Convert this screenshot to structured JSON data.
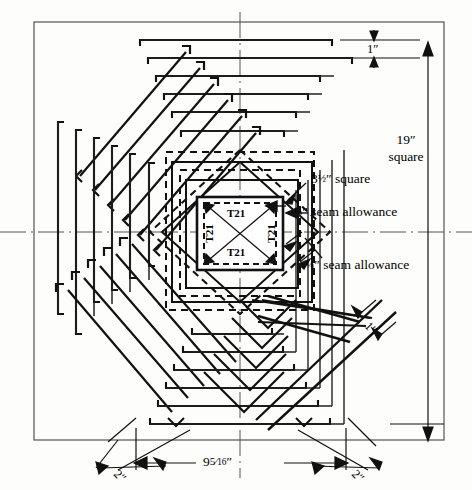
{
  "figure": {
    "kind": "quilting-pattern-diagram"
  },
  "labels": {
    "center_square": "3½″ square",
    "seam_allowance_top": "¼″ seam allowance",
    "seam_allowance_bottom": "¼″ seam allowance",
    "strip_width_top": "1″",
    "strip_width_diagonal": "1″",
    "block_size_line1": "19″",
    "block_size_line2": "square",
    "bottom_center": "9⁵⁄₁₆″",
    "bottom_left": "2″",
    "bottom_right": "2″"
  },
  "center_patch": {
    "label_top": "T21",
    "label_left": "T21",
    "label_right": "T21",
    "label_bottom": "T21"
  },
  "bottom_center_parts": {
    "whole": "9",
    "numerator": "5",
    "denominator": "16",
    "unit": "″"
  },
  "center_square_parts": {
    "whole": "3",
    "fraction": "½",
    "unit": "″",
    "word": "square"
  },
  "seam_parts": {
    "fraction": "¼",
    "unit": "″",
    "word": "seam allowance"
  },
  "colors": {
    "line": "#111111",
    "thin_line": "#333333",
    "axis": "#444444",
    "background": "#fdfdfb"
  },
  "dimensions": {
    "frame_left": 34,
    "frame_top": 22,
    "frame_right": 444,
    "frame_bottom": 440,
    "center_x": 240,
    "center_y": 232
  }
}
